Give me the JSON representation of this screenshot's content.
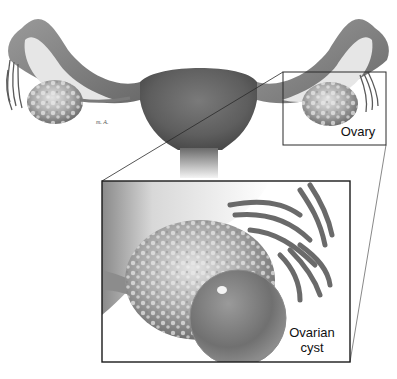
{
  "figure": {
    "type": "anatomical illustration",
    "labels": {
      "ovary": "Ovary",
      "cyst_line1": "Ovarian",
      "cyst_line2": "cyst"
    },
    "artist_signature": "m. A.",
    "colors": {
      "background": "#ffffff",
      "outline": "#2a2a2a",
      "tissue_dark": "#5a5a5a",
      "tissue_mid": "#8a8a8a",
      "tissue_light": "#c8c8c8",
      "highlight": "#eeeeee"
    },
    "callout_box": {
      "x": 283,
      "y": 72,
      "w": 103,
      "h": 73
    },
    "inset_box": {
      "x": 102,
      "y": 181,
      "w": 248,
      "h": 181
    }
  }
}
